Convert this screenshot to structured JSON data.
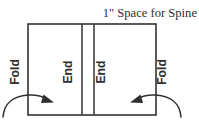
{
  "diagram": {
    "title": "1\" Space for Spine",
    "labels": {
      "fold_left": "Fold",
      "end_left": "End",
      "end_right": "End",
      "fold_right": "Fold"
    },
    "icons": {
      "left_arrow": "curved-arrow-right-icon",
      "right_arrow": "curved-arrow-left-icon"
    },
    "colors": {
      "line": "#333333",
      "text": "#2f2f2f",
      "background": "#ffffff"
    },
    "geometry": {
      "box_left": 28,
      "box_top": 24,
      "box_right": 156,
      "box_bottom": 115,
      "spine_line_1_x": 82,
      "spine_line_2_x": 94
    }
  }
}
